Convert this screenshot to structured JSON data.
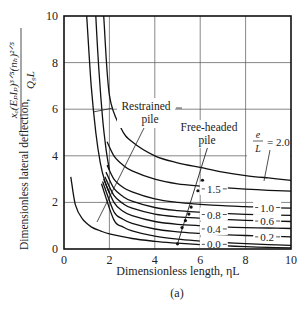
{
  "chart_data": {
    "type": "line",
    "title": "",
    "caption": "(a)",
    "xlabel": "Dimensionless length, ηL",
    "ylabel_text": "Dimensionless lateral deflection,",
    "ylabel_formula_num": "xₒ(EₚIₚ)³ᐟ⁵(nₕ)²ᐟ⁵",
    "ylabel_formula_den": "Q₉L",
    "xlim": [
      0,
      10
    ],
    "ylim": [
      0,
      10
    ],
    "xticks": [
      "0",
      "2",
      "4",
      "6",
      "8",
      "10"
    ],
    "yticks": [
      "0",
      "2",
      "4",
      "6",
      "8",
      "10"
    ],
    "grid": true,
    "annotations": {
      "restrained": [
        "Restrained",
        "pile"
      ],
      "free_headed": [
        "Free-headed",
        "pile"
      ],
      "eL_num": "e",
      "eL_den": "L",
      "eL_eq": "= 2.0"
    },
    "series": [
      {
        "name": "Free-headed e/L = 2.0",
        "label": "",
        "x": [
          1.75,
          2.0,
          2.5,
          3,
          4,
          5,
          6,
          7,
          8,
          9,
          10
        ],
        "y": [
          10,
          6.6,
          5.2,
          4.6,
          4.0,
          3.7,
          3.5,
          3.3,
          3.15,
          3.05,
          2.95
        ]
      },
      {
        "name": "Free-headed e/L = 1.5",
        "label": "1.5",
        "x": [
          1.9,
          2.2,
          2.6,
          3,
          4,
          5,
          6,
          7,
          8,
          9,
          10
        ],
        "y": [
          4.6,
          4.0,
          3.6,
          3.35,
          3.0,
          2.8,
          2.7,
          2.63,
          2.57,
          2.52,
          2.48
        ]
      },
      {
        "name": "Free-headed e/L = 1.0",
        "label": "1.0",
        "x": [
          1.9,
          2.2,
          2.6,
          3,
          4,
          5,
          6,
          7,
          8,
          9,
          10
        ],
        "y": [
          3.6,
          3.0,
          2.65,
          2.45,
          2.15,
          2.0,
          1.92,
          1.86,
          1.82,
          1.78,
          1.75
        ]
      },
      {
        "name": "Free-headed e/L = 0.8",
        "label": "0.8",
        "x": [
          1.85,
          2.2,
          2.6,
          3,
          4,
          5,
          6,
          7,
          8,
          9,
          10
        ],
        "y": [
          3.3,
          2.6,
          2.25,
          2.05,
          1.78,
          1.65,
          1.58,
          1.53,
          1.49,
          1.46,
          1.44
        ]
      },
      {
        "name": "Free-headed e/L = 0.6",
        "label": "0.6",
        "x": [
          1.8,
          2.2,
          2.6,
          3,
          4,
          5,
          6,
          7,
          8,
          9,
          10
        ],
        "y": [
          3.1,
          2.3,
          1.95,
          1.75,
          1.5,
          1.38,
          1.32,
          1.27,
          1.23,
          1.2,
          1.18
        ]
      },
      {
        "name": "Free-headed e/L = 0.4",
        "label": "0.4",
        "x": [
          1.75,
          2.2,
          2.6,
          3,
          4,
          5,
          6,
          7,
          8,
          9,
          10
        ],
        "y": [
          3.0,
          2.0,
          1.62,
          1.43,
          1.18,
          1.06,
          1.0,
          0.95,
          0.92,
          0.9,
          0.88
        ]
      },
      {
        "name": "Free-headed e/L = 0.2",
        "label": "0.2",
        "x": [
          1.7,
          2.2,
          2.6,
          3,
          4,
          5,
          6,
          7,
          8,
          9,
          10
        ],
        "y": [
          2.9,
          1.6,
          1.28,
          1.1,
          0.86,
          0.74,
          0.67,
          0.62,
          0.58,
          0.55,
          0.52
        ]
      },
      {
        "name": "Free-headed e/L = 0.0",
        "label": "0.0",
        "x": [
          1.65,
          2.2,
          2.6,
          3,
          4,
          5,
          6,
          7,
          8,
          9,
          10
        ],
        "y": [
          2.8,
          1.25,
          0.95,
          0.78,
          0.55,
          0.42,
          0.34,
          0.28,
          0.23,
          0.19,
          0.16
        ]
      },
      {
        "name": "Restrained pile",
        "label": "",
        "x": [
          0.3,
          0.5,
          0.8,
          1.2,
          1.6,
          2,
          3,
          4,
          5,
          6,
          7,
          8,
          9,
          10
        ],
        "y": [
          3.1,
          1.9,
          1.3,
          0.95,
          0.78,
          0.65,
          0.45,
          0.33,
          0.25,
          0.19,
          0.14,
          0.1,
          0.07,
          0.05
        ]
      },
      {
        "name": "Steep branch A",
        "label": "",
        "x": [
          1.0,
          1.2,
          1.4,
          1.6,
          1.8,
          2.0
        ],
        "y": [
          10,
          7.0,
          5.0,
          3.7,
          2.9,
          2.4
        ]
      },
      {
        "name": "Steep branch B",
        "label": "",
        "x": [
          1.4,
          1.55,
          1.7,
          1.85,
          2.0
        ],
        "y": [
          10,
          7.5,
          5.6,
          4.3,
          3.4
        ]
      }
    ],
    "free_headed_markers": {
      "x": [
        6.1,
        5.9,
        5.6,
        5.5,
        5.35,
        5.2,
        5.0
      ],
      "y": [
        2.95,
        2.5,
        1.8,
        1.5,
        1.22,
        0.92,
        0.22
      ]
    },
    "label_positions": {
      "1.5": [
        6.6,
        2.58
      ],
      "1.0": [
        8.95,
        1.78
      ],
      "0.8": [
        6.6,
        1.48
      ],
      "0.6": [
        8.95,
        1.2
      ],
      "0.4": [
        6.6,
        0.86
      ],
      "0.2": [
        8.95,
        0.52
      ],
      "0.0": [
        6.6,
        0.2
      ]
    }
  }
}
